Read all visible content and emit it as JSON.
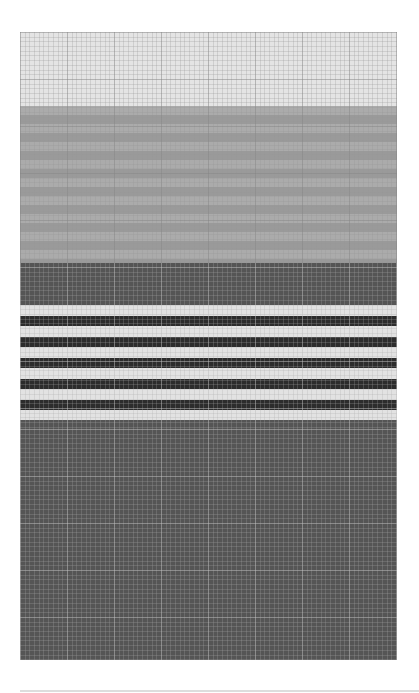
{
  "chart_data": {
    "type": "pattern-grid",
    "title": "",
    "grid": {
      "cell_px": 4.7,
      "major_every": 10,
      "columns": 80,
      "rows": 133
    },
    "bands": [
      {
        "name": "light-gray",
        "color": "#e4e4e4",
        "top": 0,
        "height": 74
      },
      {
        "name": "mid-gray",
        "color": "#a2a2a2",
        "top": 74,
        "height": 157,
        "substripes": true
      },
      {
        "name": "dark-gray",
        "color": "#555555",
        "top": 231,
        "height": 42
      },
      {
        "name": "stripe-light-1",
        "color": "#e2e2e2",
        "top": 273,
        "height": 10.5
      },
      {
        "name": "stripe-dark-1",
        "color": "#2c2c2c",
        "top": 283.5,
        "height": 10.5
      },
      {
        "name": "stripe-light-2",
        "color": "#e2e2e2",
        "top": 294,
        "height": 10.5
      },
      {
        "name": "stripe-dark-2",
        "color": "#2c2c2c",
        "top": 304.5,
        "height": 10.5
      },
      {
        "name": "stripe-light-3",
        "color": "#e2e2e2",
        "top": 315,
        "height": 10.5
      },
      {
        "name": "stripe-dark-3",
        "color": "#2c2c2c",
        "top": 325.5,
        "height": 10.5
      },
      {
        "name": "stripe-light-4",
        "color": "#e2e2e2",
        "top": 336,
        "height": 10.5
      },
      {
        "name": "stripe-dark-4",
        "color": "#2c2c2c",
        "top": 346.5,
        "height": 10.5
      },
      {
        "name": "stripe-light-5",
        "color": "#e2e2e2",
        "top": 357,
        "height": 10.5
      },
      {
        "name": "stripe-dark-5",
        "color": "#2c2c2c",
        "top": 367.5,
        "height": 10.5
      },
      {
        "name": "stripe-light-6",
        "color": "#e2e2e2",
        "top": 378,
        "height": 10
      },
      {
        "name": "dark-gray-bottom",
        "color": "#555555",
        "top": 388,
        "height": 240
      }
    ]
  },
  "colors": {
    "page_background": "#ffffff",
    "footer_rule": "#dddddd"
  }
}
